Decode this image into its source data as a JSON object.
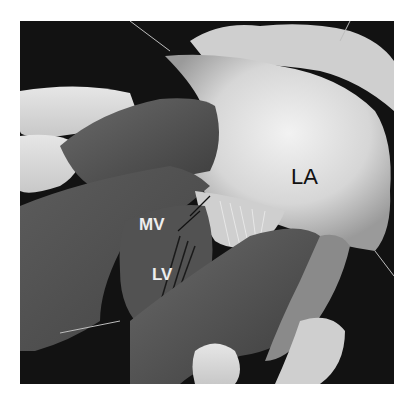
{
  "figure": {
    "type": "anatomical-photograph",
    "colors": {
      "background": "#ffffff",
      "photo_background": "#111111",
      "tissue_light": "#d9d9d9",
      "tissue_dark": "#4a4a4a",
      "label_dark": "#111111",
      "label_light": "#eeeeee"
    },
    "labels": {
      "la": "LA",
      "mv": "MV",
      "lv": "LV"
    }
  }
}
